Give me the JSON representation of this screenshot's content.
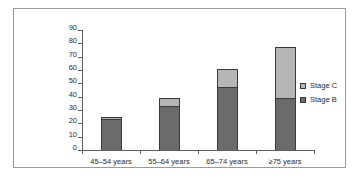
{
  "chart_data": {
    "type": "bar",
    "subtype": "stacked-vertical",
    "title": "",
    "subtitle": "",
    "xlabel": "",
    "ylabel": "",
    "categories": [
      "45–54 years",
      "55–64 years",
      "65–74 years",
      "≥75 years"
    ],
    "series": [
      {
        "name": "Stage B",
        "values": [
          23,
          33,
          47,
          39
        ],
        "color": "#6b6b6b"
      },
      {
        "name": "Stage C",
        "values": [
          2,
          6,
          14,
          38
        ],
        "color": "#b6b6b6"
      }
    ],
    "totals": [
      25,
      39,
      61,
      77
    ],
    "ylim": [
      0,
      90
    ],
    "ytick_step": 10,
    "yticks": [
      0,
      10,
      20,
      30,
      40,
      50,
      60,
      70,
      80,
      90
    ],
    "ytick_labels": [
      "0",
      "10",
      "20",
      "30",
      "40",
      "50",
      "60",
      "70",
      "80",
      "90"
    ],
    "grid": false,
    "legend_position": "right",
    "legend_entries": [
      "Stage C",
      "Stage B"
    ],
    "annotations": []
  },
  "figure": {
    "frame_color": "#9a9a9a",
    "background_color": "#ffffff",
    "axis_color": "#5d5d5d",
    "text_color": "#2b2b2b"
  }
}
